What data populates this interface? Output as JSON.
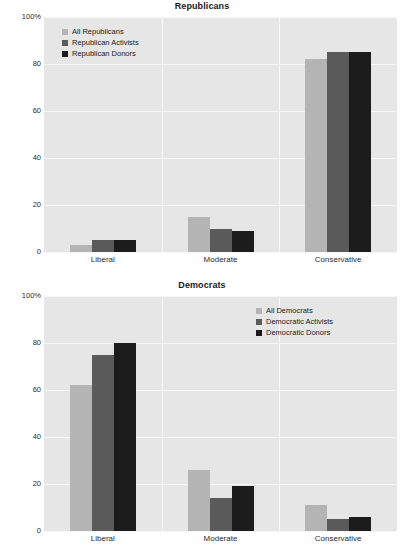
{
  "chart_data": [
    {
      "type": "bar",
      "title": "Republicans",
      "xlabel": "",
      "ylabel": "",
      "ylim": [
        0,
        100
      ],
      "yticks": [
        "0",
        "20",
        "40",
        "60",
        "80",
        "100%"
      ],
      "ytick_values": [
        0,
        20,
        40,
        60,
        80,
        100
      ],
      "grid": true,
      "legend_position": "top-left",
      "categories": [
        "Liberal",
        "Moderate",
        "Conservative"
      ],
      "series": [
        {
          "name": "All Republicans",
          "color": "#b4b4b4",
          "values": [
            3,
            15,
            82
          ]
        },
        {
          "name": "Republican Activists",
          "color": "#5a5a5a",
          "values": [
            5,
            10,
            85
          ]
        },
        {
          "name": "Republican Donors",
          "color": "#1c1c1c",
          "values": [
            5,
            9,
            85
          ]
        }
      ]
    },
    {
      "type": "bar",
      "title": "Democrats",
      "xlabel": "",
      "ylabel": "",
      "ylim": [
        0,
        100
      ],
      "yticks": [
        "0",
        "20",
        "40",
        "60",
        "80",
        "100%"
      ],
      "ytick_values": [
        0,
        20,
        40,
        60,
        80,
        100
      ],
      "grid": true,
      "legend_position": "top-right",
      "categories": [
        "Liberal",
        "Moderate",
        "Conservative"
      ],
      "series": [
        {
          "name": "All Democrats",
          "color": "#b4b4b4",
          "values": [
            62,
            26,
            11
          ]
        },
        {
          "name": "Democratic Activists",
          "color": "#5a5a5a",
          "values": [
            75,
            14,
            5
          ]
        },
        {
          "name": "Democratic Donors",
          "color": "#1c1c1c",
          "values": [
            80,
            19,
            6
          ]
        }
      ]
    }
  ]
}
